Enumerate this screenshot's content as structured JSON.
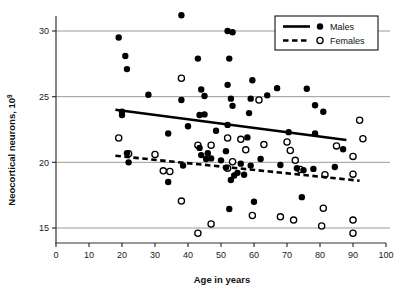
{
  "chart_data": {
    "type": "scatter",
    "title": "",
    "xlabel": "Age in years",
    "ylabel": "Neocortical neurons, 10⁹",
    "ylabel_base": "Neocortical neurons, 10",
    "ylabel_exponent": "9",
    "xlim": [
      0,
      100
    ],
    "ylim": [
      14.2,
      31.6
    ],
    "xticks": [
      0,
      10,
      20,
      30,
      40,
      50,
      60,
      70,
      80,
      90,
      100
    ],
    "yticks": [
      15,
      20,
      25,
      30
    ],
    "xtick_labels": [
      "0",
      "10",
      "20",
      "30",
      "40",
      "50",
      "60",
      "70",
      "80",
      "90",
      "100"
    ],
    "ytick_labels": [
      "15",
      "20",
      "25",
      "30"
    ],
    "grid": "horizontal",
    "grid_color": "#9a9a9a",
    "legend_position": "top-right",
    "series": [
      {
        "name": "Males",
        "marker": "filled-circle",
        "color": "#000000",
        "trendline_style": "solid",
        "trendline": {
          "x1": 18,
          "y1": 24.0,
          "x2": 88,
          "y2": 21.7
        },
        "points": [
          [
            19,
            29.5
          ],
          [
            21,
            28.1
          ],
          [
            21.5,
            27.1
          ],
          [
            28,
            25.15
          ],
          [
            38,
            31.2
          ],
          [
            38,
            24.75
          ],
          [
            34,
            22.2
          ],
          [
            34,
            18.5
          ],
          [
            38.5,
            19.75
          ],
          [
            40,
            22.75
          ],
          [
            43,
            27.9
          ],
          [
            44,
            25.55
          ],
          [
            43.5,
            23.6
          ],
          [
            45,
            23.65
          ],
          [
            45,
            25.05
          ],
          [
            43.5,
            21.1
          ],
          [
            44,
            20.55
          ],
          [
            45.5,
            20.25
          ],
          [
            46,
            20.7
          ],
          [
            47,
            20.3
          ],
          [
            48.5,
            22.4
          ],
          [
            50,
            20.15
          ],
          [
            52,
            25.9
          ],
          [
            52,
            30.0
          ],
          [
            53.5,
            29.9
          ],
          [
            52.5,
            27.9
          ],
          [
            52,
            22.85
          ],
          [
            53,
            24.85
          ],
          [
            53.5,
            24.3
          ],
          [
            51.5,
            20.85
          ],
          [
            51.5,
            19.6
          ],
          [
            52.5,
            16.45
          ],
          [
            53,
            18.65
          ],
          [
            54,
            19.0
          ],
          [
            55,
            19.2
          ],
          [
            56,
            19.9
          ],
          [
            58,
            21.9
          ],
          [
            59,
            24.85
          ],
          [
            59.5,
            26.25
          ],
          [
            58.5,
            23.75
          ],
          [
            59,
            19.75
          ],
          [
            60,
            17.0
          ],
          [
            62,
            20.25
          ],
          [
            64,
            25.1
          ],
          [
            67,
            25.65
          ],
          [
            68,
            19.8
          ],
          [
            70.5,
            22.3
          ],
          [
            73,
            19.55
          ],
          [
            74.5,
            17.35
          ],
          [
            76,
            25.6
          ],
          [
            78,
            19.5
          ],
          [
            78.5,
            24.35
          ],
          [
            78.5,
            22.2
          ],
          [
            81,
            23.85
          ],
          [
            84.5,
            19.65
          ],
          [
            87,
            21.0
          ],
          [
            20,
            23.85
          ],
          [
            20,
            23.6
          ],
          [
            21.5,
            20.7
          ],
          [
            22,
            20.0
          ],
          [
            57,
            19.05
          ],
          [
            75,
            19.4
          ]
        ]
      },
      {
        "name": "Females",
        "marker": "open-circle",
        "color": "#000000",
        "trendline_style": "dashed",
        "trendline": {
          "x1": 18,
          "y1": 20.5,
          "x2": 92,
          "y2": 18.6
        },
        "points": [
          [
            19,
            21.85
          ],
          [
            22,
            20.65
          ],
          [
            30,
            20.6
          ],
          [
            32.5,
            19.35
          ],
          [
            34.5,
            19.3
          ],
          [
            38,
            26.4
          ],
          [
            38,
            17.05
          ],
          [
            43,
            14.6
          ],
          [
            43,
            21.3
          ],
          [
            47,
            15.3
          ],
          [
            52,
            21.85
          ],
          [
            53.5,
            20.05
          ],
          [
            56,
            21.75
          ],
          [
            57.5,
            20.95
          ],
          [
            59.5,
            15.95
          ],
          [
            61.5,
            24.75
          ],
          [
            63,
            21.35
          ],
          [
            68,
            15.85
          ],
          [
            70,
            21.55
          ],
          [
            71,
            20.9
          ],
          [
            72,
            15.6
          ],
          [
            72.5,
            20.15
          ],
          [
            74,
            19.45
          ],
          [
            80.5,
            15.15
          ],
          [
            81,
            16.5
          ],
          [
            81.5,
            19.05
          ],
          [
            85,
            21.25
          ],
          [
            90,
            15.6
          ],
          [
            90,
            14.6
          ],
          [
            90,
            20.45
          ],
          [
            90,
            19.1
          ],
          [
            92,
            23.2
          ],
          [
            93,
            21.8
          ],
          [
            52,
            19.55
          ],
          [
            47,
            21.3
          ]
        ]
      }
    ]
  },
  "legend": {
    "entries": [
      {
        "label": "Males",
        "line_style": "solid",
        "marker": "filled-circle"
      },
      {
        "label": "Females",
        "line_style": "dashed",
        "marker": "open-circle"
      }
    ]
  }
}
